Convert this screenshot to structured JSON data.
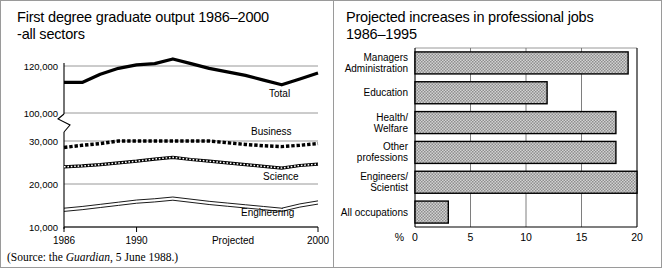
{
  "figure": {
    "panels": [
      {
        "id": "line-chart",
        "title": "First degree graduate output 1986–2000\n-all sectors",
        "source_prefix": "(Source: the ",
        "source_italic": "Guardian",
        "source_suffix": ", 5 June 1988.)"
      },
      {
        "id": "bar-chart",
        "title": "Projected increases in professional jobs\n1986–1995"
      }
    ]
  },
  "chart_data": [
    {
      "type": "line",
      "title": "First degree graduate output 1986–2000 -all sectors",
      "xlabel": "",
      "ylabel": "",
      "grid": true,
      "legend_position": "inline-right",
      "axis_break": true,
      "note": "Projected",
      "source": "(Source: the Guardian, 5 June 1988.)",
      "x": [
        1986,
        1987,
        1988,
        1989,
        1990,
        1991,
        1992,
        1993,
        1994,
        1995,
        1996,
        1997,
        1998,
        1999,
        2000
      ],
      "xticks": [
        1986,
        1990,
        2000
      ],
      "xticklabels": [
        "1986",
        "1990",
        "2000"
      ],
      "yticks": [
        10000,
        20000,
        30000,
        100000,
        120000
      ],
      "yticklabels": [
        "10,000",
        "20,000",
        "30,000",
        "100,000",
        "120,000"
      ],
      "ylim": [
        10000,
        125000
      ],
      "series": [
        {
          "name": "Total",
          "style": "thick-solid",
          "values": [
            113000,
            113000,
            116500,
            119000,
            120500,
            121000,
            123000,
            121000,
            119000,
            117500,
            116000,
            114000,
            112000,
            114500,
            117000
          ]
        },
        {
          "name": "Business",
          "style": "thick-dotted",
          "values": [
            28500,
            29000,
            29400,
            30000,
            30400,
            30300,
            30800,
            30400,
            30000,
            29600,
            29200,
            28900,
            28700,
            29000,
            29400
          ]
        },
        {
          "name": "Science",
          "style": "beaded",
          "values": [
            24000,
            24200,
            24500,
            24900,
            25300,
            25800,
            26200,
            25700,
            25300,
            24900,
            24500,
            24100,
            23700,
            24300,
            24600
          ]
        },
        {
          "name": "Engineering",
          "style": "double-thin",
          "values": [
            14000,
            14400,
            14900,
            15400,
            15900,
            16200,
            16600,
            16100,
            15600,
            15200,
            14800,
            14400,
            14000,
            15000,
            15700
          ]
        }
      ]
    },
    {
      "type": "bar",
      "orientation": "horizontal",
      "title": "Projected increases in professional jobs 1986–1995",
      "xlabel": "%",
      "ylabel": "",
      "grid": true,
      "xlim": [
        0,
        20
      ],
      "xticks": [
        0,
        5,
        10,
        15,
        20
      ],
      "xticklabels": [
        "0",
        "5",
        "10",
        "15",
        "20"
      ],
      "categories": [
        "Managers\nAdministration",
        "Education",
        "Health/\nWelfare",
        "Other\nprofessions",
        "Engineers/\nScientist",
        "All occupations"
      ],
      "values": [
        19.2,
        11.9,
        18.1,
        18.1,
        20.0,
        3.0
      ]
    }
  ]
}
